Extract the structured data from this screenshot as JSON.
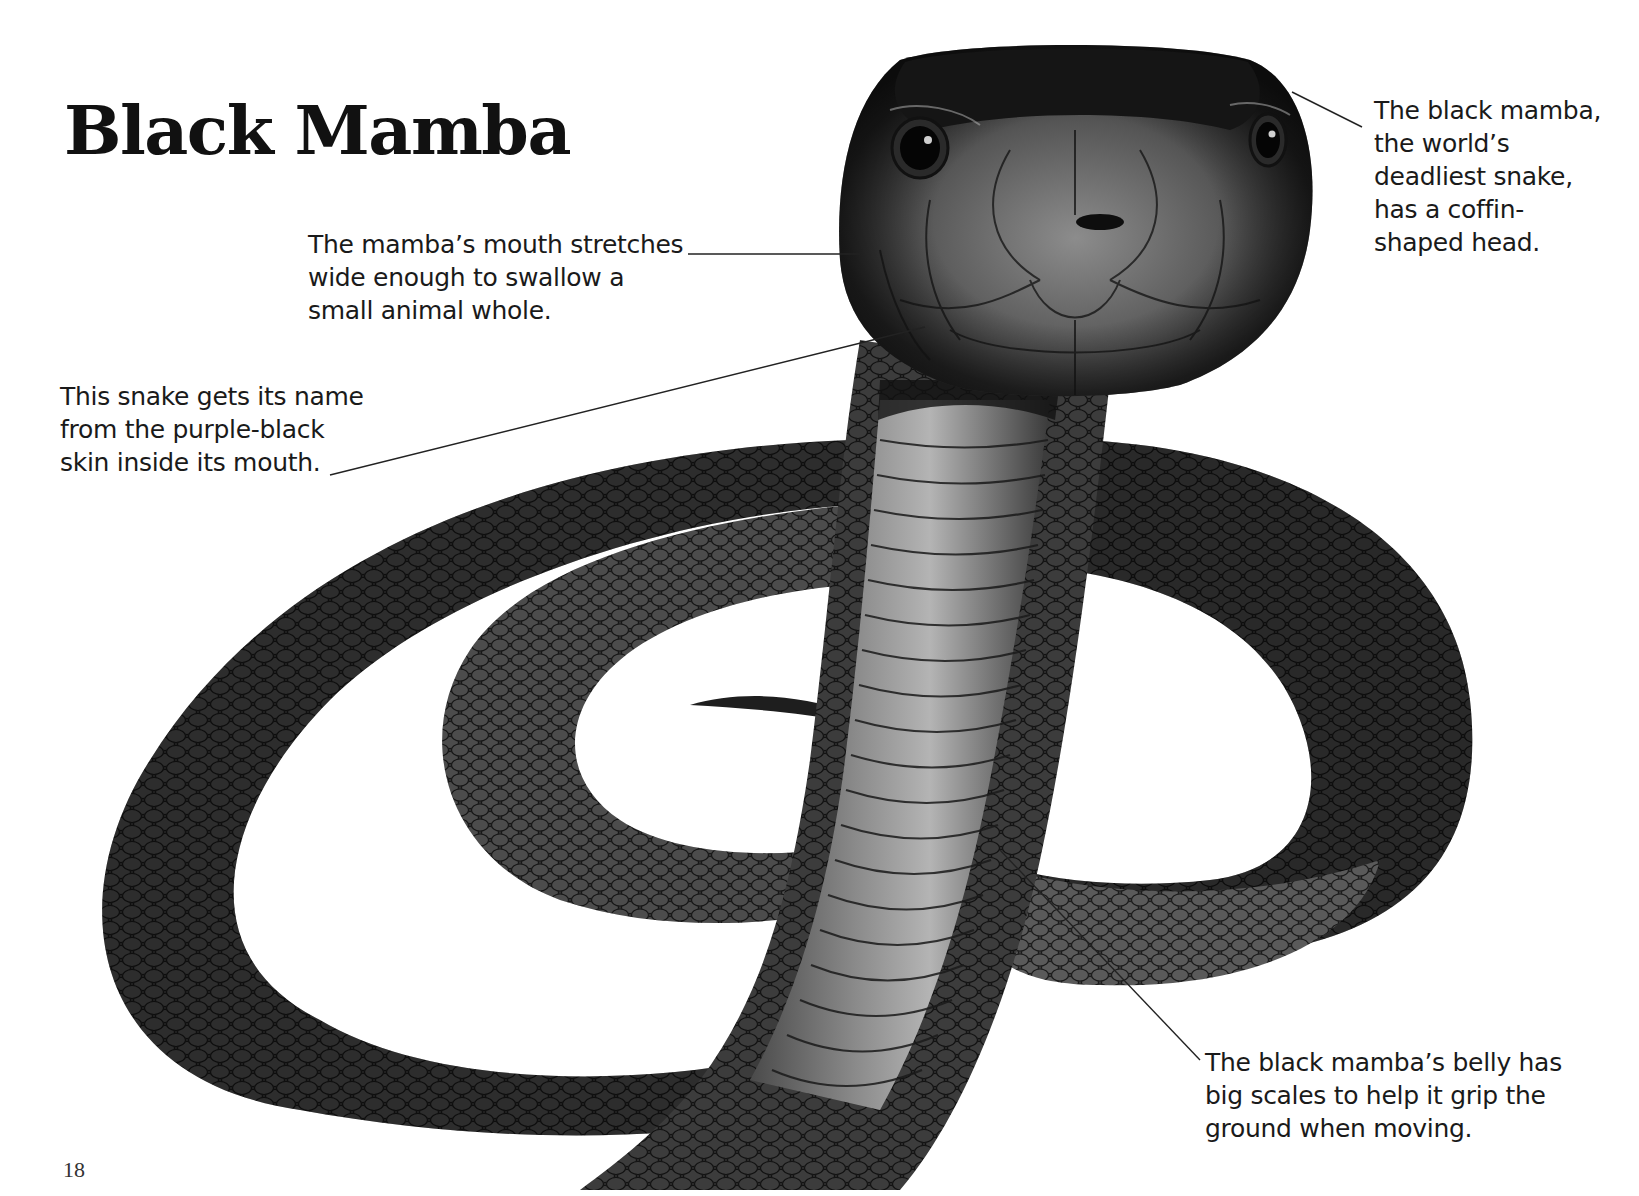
{
  "page": {
    "title": "Black Mamba",
    "page_number": "18"
  },
  "illustration": {
    "subject": "black mamba snake, coiled with head raised",
    "palette": {
      "body_dark": "#1e1e1e",
      "body_mid": "#3a3a3a",
      "belly_light": "#9a9a9a",
      "background": "#ffffff"
    }
  },
  "callouts": [
    {
      "id": "mouth",
      "lines": [
        "The mamba’s mouth stretches",
        "wide enough to swallow a",
        "small animal whole."
      ]
    },
    {
      "id": "name",
      "lines": [
        "This snake gets its name",
        "from the purple-black",
        "skin inside its mouth."
      ]
    },
    {
      "id": "head",
      "lines": [
        "The black mamba,",
        "the world’s",
        "deadliest snake,",
        "has a coffin-",
        "shaped head."
      ]
    },
    {
      "id": "belly",
      "lines": [
        "The black mamba’s belly has",
        "big scales to help it grip the",
        "ground when moving."
      ]
    }
  ]
}
